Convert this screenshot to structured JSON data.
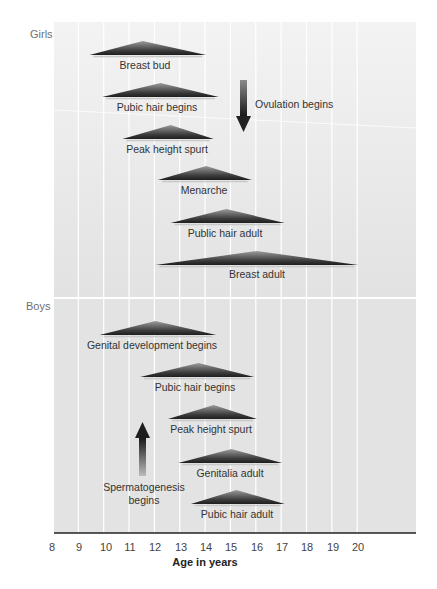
{
  "chart_data": {
    "type": "timeline",
    "title": "",
    "xlabel": "Age in years",
    "ylabel": "",
    "xlim": [
      8,
      21.5
    ],
    "x_ticks": [
      8,
      9,
      10,
      11,
      12,
      13,
      14,
      15,
      16,
      17,
      18,
      19,
      20
    ],
    "grid": true,
    "sections": [
      {
        "name": "Girls",
        "events": [
          {
            "label": "Breast bud",
            "start": 9.4,
            "peak": 11.5,
            "end": 14.0
          },
          {
            "label": "Pubic hair begins",
            "start": 9.9,
            "peak": 12.2,
            "end": 14.5
          },
          {
            "label": "Peak height spurt",
            "start": 10.7,
            "peak": 12.6,
            "end": 14.3
          },
          {
            "label": "Menarche",
            "start": 12.1,
            "peak": 14.0,
            "end": 15.8
          },
          {
            "label": "Public hair adult",
            "start": 12.6,
            "peak": 14.8,
            "end": 17.1
          },
          {
            "label": "Breast adult",
            "start": 12.0,
            "peak": 16.0,
            "end": 20.0
          }
        ],
        "annotations": [
          {
            "label": "Ovulation begins",
            "x": 15.4,
            "arrow": "down"
          }
        ]
      },
      {
        "name": "Boys",
        "events": [
          {
            "label": "Genital development begins",
            "start": 9.8,
            "peak": 12.0,
            "end": 14.4
          },
          {
            "label": "Pubic hair begins",
            "start": 11.4,
            "peak": 13.7,
            "end": 15.9
          },
          {
            "label": "Peak height spurt",
            "start": 12.5,
            "peak": 14.3,
            "end": 16.0
          },
          {
            "label": "Genitalia adult",
            "start": 12.9,
            "peak": 15.0,
            "end": 17.0
          },
          {
            "label": "Pubic hair adult",
            "start": 13.4,
            "peak": 15.2,
            "end": 17.1
          }
        ],
        "annotations": [
          {
            "label": "Spermatogenesis begins",
            "x": 11.8,
            "arrow": "up"
          }
        ]
      }
    ]
  },
  "labels": {
    "girls": "Girls",
    "boys": "Boys",
    "xlabel": "Age in years",
    "ovulation": "Ovulation begins",
    "sperm_line1": "Spermatogenesis",
    "sperm_line2": "begins"
  },
  "ticks": [
    "8",
    "9",
    "10",
    "11",
    "12",
    "13",
    "14",
    "15",
    "16",
    "17",
    "18",
    "19",
    "20"
  ],
  "girls_events": [
    {
      "label": "Breast bud"
    },
    {
      "label": "Pubic hair begins"
    },
    {
      "label": "Peak height spurt"
    },
    {
      "label": "Menarche"
    },
    {
      "label": "Public hair adult"
    },
    {
      "label": "Breast adult"
    }
  ],
  "boys_events": [
    {
      "label": "Genital development begins"
    },
    {
      "label": "Pubic hair begins"
    },
    {
      "label": "Peak height spurt"
    },
    {
      "label": "Genitalia adult"
    },
    {
      "label": "Pubic hair adult"
    }
  ],
  "colors": {
    "panel": "#e4e4e4",
    "grid": "#ffffff",
    "triangle_dark": "#2e2e2e",
    "triangle_light": "#a0a0a0",
    "axis": "#222222"
  }
}
